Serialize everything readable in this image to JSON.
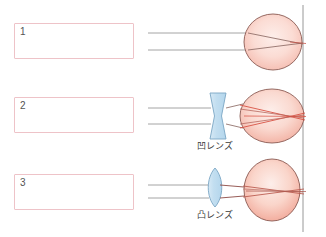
{
  "page": {
    "background_color": "#ffffff"
  },
  "colors": {
    "box_border": "#eec3c8",
    "box_fill": "#ffffff",
    "box_number_text": "#545454",
    "incoming_ray": "#9a9a9a",
    "refracted_ray": "#d64a3c",
    "refracted_ray_dark": "#8c4a44",
    "eye_outline": "#8a5a52",
    "eye_fill_light": "#fbe2dc",
    "eye_fill_mid": "#f6c3b8",
    "lens_outline": "#7ba6c4",
    "lens_fill": "#cfe4f2",
    "retina_line": "#8d8d8d",
    "caption_text": "#3a3a3a"
  },
  "rows": [
    {
      "id": "row-1",
      "answer_box": {
        "number": "1",
        "value": ""
      },
      "lens": null,
      "lens_caption": null,
      "eye_type": "normal-round-eye"
    },
    {
      "id": "row-2",
      "answer_box": {
        "number": "2",
        "value": ""
      },
      "lens": "concave-lens",
      "lens_caption": "凹レンズ",
      "eye_type": "elongated-eye-myopia"
    },
    {
      "id": "row-3",
      "answer_box": {
        "number": "3",
        "value": ""
      },
      "lens": "convex-lens",
      "lens_caption": "凸レンズ",
      "eye_type": "flattened-eye-hyperopia"
    }
  ],
  "vertical_reference_line": {
    "name": "retina-reference-line",
    "x": 303,
    "color": "#8d8d8d"
  }
}
